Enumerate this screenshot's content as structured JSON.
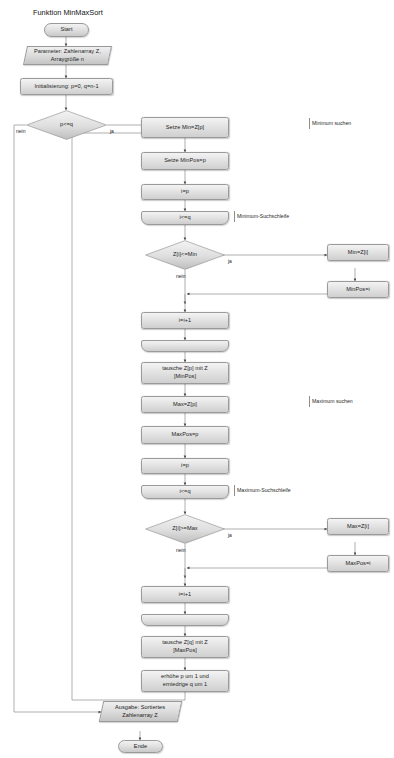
{
  "diagram": {
    "title": "Funktion MinMaxSort",
    "language": "de"
  },
  "nodes": {
    "start": "Start",
    "params": "Parameter: Zahlenarray Z,\nArraygröße n",
    "init": "Initialisierung: p=0, q=n-1",
    "outer_cond": "p<=q",
    "set_min": "Setze Min=Z[p]",
    "set_minpos": "Setze MinPos=p",
    "i_eq_p_min": "i=p",
    "min_loop": "i<=q",
    "cond_min": "Z[i]<=Min",
    "min_assign": "Min=Z[i]",
    "minpos_assign": "MinPos=i",
    "i_inc_min": "i=i+1",
    "swap_min": "tausche Z[p] mit Z\n[MinPos]",
    "set_max": "Max=Z[p]",
    "set_maxpos": "MaxPos=p",
    "i_eq_p_max": "i=p",
    "max_loop": "i<=q",
    "cond_max": "Z[i]>=Max",
    "max_assign": "Max=Z[i]",
    "maxpos_assign": "MaxPos=i",
    "i_inc_max": "i=i+1",
    "swap_max": "tausche Z[q] mit Z\n[MaxPos]",
    "adjust": "erhöhe p um 1 und\nerniedrige q um 1",
    "output": "Ausgabe: Sortiertes\nZahlenarray Z",
    "end": "Ende"
  },
  "branch_labels": {
    "outer_no": "nein",
    "outer_yes": "ja",
    "min_yes": "ja",
    "min_no": "nein",
    "max_yes": "ja",
    "max_no": "nein"
  },
  "annotations": {
    "min_search": "Minimum suchen",
    "min_loop_note": "Minimum-Suchschleife",
    "max_search": "Maximum suchen",
    "max_loop_note": "Maximum-Suchschleife"
  },
  "style": {
    "line_color": "#8d8d8d",
    "text_color": "#1d1d1d",
    "fill_light": "#f2f2f2",
    "fill_dark": "#cdcdcd"
  }
}
